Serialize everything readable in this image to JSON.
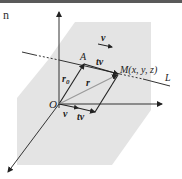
{
  "figure": {
    "corner_fragment": "n",
    "labels": {
      "origin": "O",
      "point_a": "A",
      "point_m": "M(x, y, z)",
      "line": "L",
      "r0_main": "r",
      "r0_sub": "0",
      "r": "r",
      "tv_top": "tv",
      "v_bottom": "v",
      "tv_bottom": "tv",
      "v_direction": "v"
    },
    "colors": {
      "plane": "#e4e4e4",
      "axis": "#333333",
      "vector": "#222222",
      "r_vector": "#9a9a9a",
      "top_bar": "#5a5a5a"
    }
  }
}
